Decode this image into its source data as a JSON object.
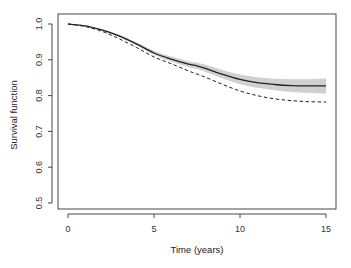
{
  "chart_data": {
    "type": "line",
    "title": "",
    "xlabel": "Time (years)",
    "ylabel": "Survival function",
    "xlim": [
      0,
      15
    ],
    "ylim": [
      0.5,
      1.0
    ],
    "x_ticks": [
      0,
      5,
      10,
      15
    ],
    "y_ticks": [
      0.5,
      0.6,
      0.7,
      0.8,
      0.9,
      1.0
    ],
    "y_tick_labels": [
      "0.5",
      "0.6",
      "0.7",
      "0.8",
      "0.9",
      "1.0"
    ],
    "grid": false,
    "legend": null,
    "x": [
      0,
      1,
      2,
      2.5,
      3,
      4,
      5,
      6,
      7,
      7.5,
      8,
      9,
      10,
      11,
      12,
      13,
      14,
      15
    ],
    "series": [
      {
        "name": "Estimated survival",
        "style": "solid",
        "color": "#222222",
        "values": [
          1.0,
          0.995,
          0.983,
          0.975,
          0.966,
          0.944,
          0.919,
          0.902,
          0.888,
          0.883,
          0.876,
          0.859,
          0.845,
          0.836,
          0.831,
          0.828,
          0.827,
          0.827
        ]
      },
      {
        "name": "Comparison survival",
        "style": "dashed",
        "color": "#222222",
        "values": [
          1.0,
          0.993,
          0.979,
          0.969,
          0.958,
          0.934,
          0.908,
          0.889,
          0.869,
          0.86,
          0.851,
          0.831,
          0.813,
          0.8,
          0.791,
          0.786,
          0.783,
          0.782
        ]
      }
    ],
    "confidence_band": {
      "name": "Confidence interval",
      "color": "#d0d0d0",
      "lower": [
        1.0,
        0.994,
        0.981,
        0.972,
        0.963,
        0.94,
        0.914,
        0.895,
        0.88,
        0.874,
        0.866,
        0.848,
        0.832,
        0.822,
        0.815,
        0.81,
        0.807,
        0.805
      ],
      "upper": [
        1.0,
        0.996,
        0.985,
        0.978,
        0.97,
        0.948,
        0.925,
        0.909,
        0.896,
        0.892,
        0.886,
        0.871,
        0.859,
        0.851,
        0.847,
        0.846,
        0.846,
        0.848
      ]
    }
  },
  "labels": {
    "xlabel": "Time (years)",
    "ylabel": "Survival function"
  }
}
